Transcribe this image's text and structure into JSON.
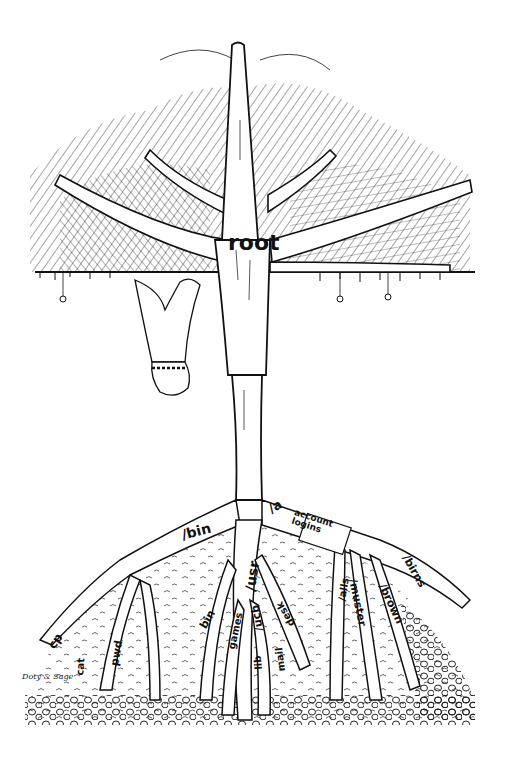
{
  "illustration": {
    "subject": "Unix file system tree",
    "root_label": "root",
    "branches": [
      {
        "id": "bin",
        "label": "/bin"
      },
      {
        "id": "usr",
        "label": "/usr"
      },
      {
        "id": "a",
        "label": "/a"
      },
      {
        "id": "account",
        "label": "account logins"
      },
      {
        "id": "birns",
        "label": "/birns"
      },
      {
        "id": "brown",
        "label": "/brown"
      },
      {
        "id": "muster",
        "label": "/muster"
      },
      {
        "id": "alis",
        "label": "/alls"
      },
      {
        "id": "cp",
        "label": "cp"
      },
      {
        "id": "cat",
        "label": "cat"
      },
      {
        "id": "pwd",
        "label": "pwd"
      },
      {
        "id": "usrbin",
        "label": "bin"
      },
      {
        "id": "games",
        "label": "games"
      },
      {
        "id": "ucb",
        "label": "/ucb"
      },
      {
        "id": "lib",
        "label": "lib"
      },
      {
        "id": "mail",
        "label": "mail"
      },
      {
        "id": "dsk",
        "label": "desk"
      }
    ],
    "signature": "Doty & Sage"
  },
  "colors": {
    "ink": "#111111",
    "paper": "#ffffff"
  }
}
